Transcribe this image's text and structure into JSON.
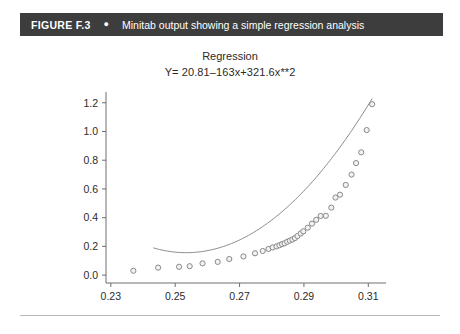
{
  "caption": {
    "figure_number": "FIGURE F.3",
    "bullet_icon": "bullet-dot",
    "text": "Minitab output showing a simple regression analysis",
    "bar_color": "#3d3d3d",
    "text_color": "#ffffff"
  },
  "chart_data": {
    "type": "scatter",
    "title": "Regression",
    "annotations": [
      "Y= 20.81–163x+321.6x**2"
    ],
    "equation": "Y= 20.81–163x+321.6x**2",
    "xlabel": "",
    "ylabel": "",
    "xlim": [
      0.2285,
      0.3155
    ],
    "ylim": [
      -0.055,
      1.275
    ],
    "xticks": [
      0.23,
      0.25,
      0.27,
      0.29,
      0.31
    ],
    "xticklabels": [
      "0.23",
      "0.25",
      "0.27",
      "0.29",
      "0.31"
    ],
    "yticks": [
      0.0,
      0.2,
      0.4,
      0.6,
      0.8,
      1.0,
      1.2
    ],
    "yticklabels": [
      "0.0",
      "0.2",
      "0.4",
      "0.6",
      "0.8",
      "1.0",
      "1.2"
    ],
    "grid": false,
    "legend": null,
    "marker": {
      "shape": "open-circle",
      "edge_color": "#8a8a8a",
      "face_color": "#f2f2f2",
      "size": 5.2
    },
    "fit_curve": {
      "name": "quadratic fit",
      "color": "#8a8a8a",
      "width": 1,
      "expression": "y = 20.81 - 163x + 321.6x**2",
      "coefficients": {
        "intercept": 20.81,
        "linear": -163,
        "quadratic": 321.6
      },
      "x_start": 0.2432,
      "x_end": 0.3112
    },
    "x": [
      0.237,
      0.2447,
      0.2512,
      0.2545,
      0.2585,
      0.2632,
      0.2668,
      0.2712,
      0.2748,
      0.2772,
      0.279,
      0.2803,
      0.2815,
      0.2824,
      0.2832,
      0.284,
      0.2848,
      0.2856,
      0.2864,
      0.2872,
      0.288,
      0.289,
      0.2898,
      0.2912,
      0.2925,
      0.2938,
      0.2952,
      0.2968,
      0.2985,
      0.2998,
      0.3012,
      0.303,
      0.3048,
      0.3062,
      0.3078,
      0.3095,
      0.3112
    ],
    "y": [
      0.03,
      0.052,
      0.058,
      0.062,
      0.082,
      0.092,
      0.112,
      0.13,
      0.152,
      0.168,
      0.182,
      0.193,
      0.2,
      0.208,
      0.216,
      0.222,
      0.232,
      0.24,
      0.248,
      0.258,
      0.272,
      0.29,
      0.305,
      0.33,
      0.358,
      0.385,
      0.412,
      0.413,
      0.47,
      0.54,
      0.56,
      0.628,
      0.7,
      0.78,
      0.855,
      1.01,
      1.19
    ],
    "series": [
      {
        "name": "observations",
        "marker": "open-circle",
        "color": "#8a8a8a"
      }
    ]
  }
}
